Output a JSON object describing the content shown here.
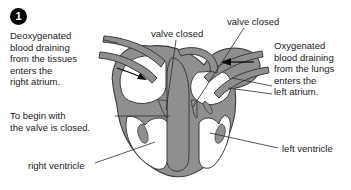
{
  "figure": {
    "step_number": "1"
  },
  "colors": {
    "heart_wall": "#8f8f8f",
    "outline": "#3a3a3a",
    "text": "#1a1a1a",
    "badge_fill": "#000000",
    "badge_text": "#ffffff",
    "leader_line": "#2b2b2b",
    "background": "#ffffff"
  },
  "callouts": {
    "deoxygenated": "Deoxygenated\nblood draining\nfrom the tissues\nenters the\nright atrium.",
    "to_begin": "To begin with\nthe valve is closed.",
    "right_ventricle": "right ventricle",
    "oxygenated": "Oxygenated\nblood draining\nfrom the lungs\nenters the\nleft atrium.",
    "left_ventricle": "left ventricle",
    "valve_closed_left": "valve closed",
    "valve_closed_right": "valve closed"
  }
}
